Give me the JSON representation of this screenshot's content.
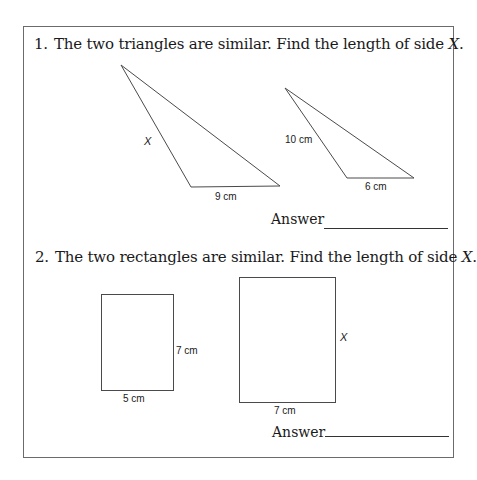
{
  "questions": [
    {
      "number": "1.",
      "prompt": "The two triangles are similar. Find the length of side ",
      "variable": "X",
      "prompt_end": ".",
      "figures": {
        "triangle_large": {
          "side_label": "X",
          "base_label": "9 cm"
        },
        "triangle_small": {
          "side_label": "10 cm",
          "base_label": "6 cm"
        }
      },
      "answer_label": "Answer",
      "answer_value": ""
    },
    {
      "number": "2.",
      "prompt": "The two rectangles are similar. Find the length of side ",
      "variable": "X",
      "prompt_end": ".",
      "figures": {
        "rectangle_small": {
          "height_label": "7 cm",
          "width_label": "5 cm"
        },
        "rectangle_large": {
          "height_label": "X",
          "width_label": "7 cm"
        }
      },
      "answer_label": "Answer",
      "answer_value": ""
    }
  ],
  "colors": {
    "line": "#4a4a4a",
    "border": "#6b6b6b",
    "text": "#1a1a1a"
  }
}
